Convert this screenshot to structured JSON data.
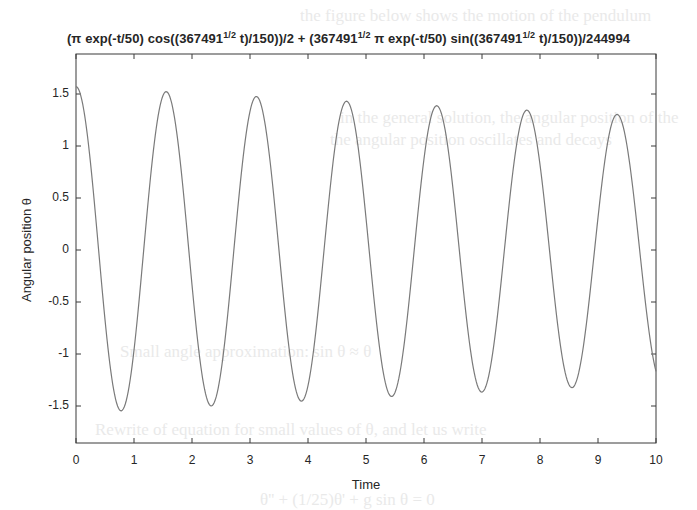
{
  "figure": {
    "title_parts": {
      "p1": "(π exp(-t/50) cos((367491",
      "s1": "1/2",
      "p2": " t)/150))/2 + (367491",
      "s2": "1/2",
      "p3": " π exp(-t/50) sin((367491",
      "s3": "1/2",
      "p4": " t)/150))/244994"
    },
    "xlabel": "Time",
    "ylabel": "Angular position θ",
    "background_text": [
      "the figure below shows the motion of the pendulum",
      "in the general solution, the angular position of the",
      "the angular position oscillates and decays",
      "Small angle approximation: sin θ ≈ θ",
      "Rewrite of equation for small values of θ, and let us write",
      "θ'' + (1/25)θ' + g sin θ = 0"
    ]
  },
  "colors": {
    "line": "#7a7a7a",
    "axes": "#3a3a3a",
    "text": "#262626",
    "background": "#ffffff"
  },
  "chart_data": {
    "type": "line",
    "xlabel": "Time",
    "ylabel": "Angular position θ",
    "xlim": [
      0,
      10
    ],
    "ylim": [
      -1.87,
      1.87
    ],
    "xticks": [
      0,
      1,
      2,
      3,
      4,
      5,
      6,
      7,
      8,
      9,
      10
    ],
    "yticks": [
      -1.5,
      -1,
      -0.5,
      0,
      0.5,
      1,
      1.5
    ],
    "ytick_labels": [
      "-1.5",
      "-1",
      "-0.5",
      "0",
      "0.5",
      "1",
      "1.5"
    ],
    "grid": false,
    "legend": null,
    "function": {
      "expression": "(pi*exp(-t/50)*cos(sqrt(367491)*t/150))/2 + (sqrt(367491)*pi*exp(-t/50)*sin(sqrt(367491)*t/150))/244994",
      "cos_coeff": 1.5707963,
      "sin_coeff": 0.0077735,
      "decay_rate": 0.02,
      "omega": 4.0414,
      "samples": 600
    },
    "series": [
      {
        "name": "theta(t)",
        "x": [
          0,
          0.78,
          1.55,
          2.33,
          3.11,
          3.89,
          4.66,
          5.44,
          6.22,
          7.0,
          7.77,
          8.55,
          9.33,
          10.0
        ],
        "values": [
          1.57,
          -1.55,
          1.52,
          -1.49,
          1.47,
          -1.45,
          1.43,
          -1.41,
          1.38,
          -1.36,
          1.34,
          -1.32,
          1.3,
          -1.14
        ]
      }
    ]
  }
}
